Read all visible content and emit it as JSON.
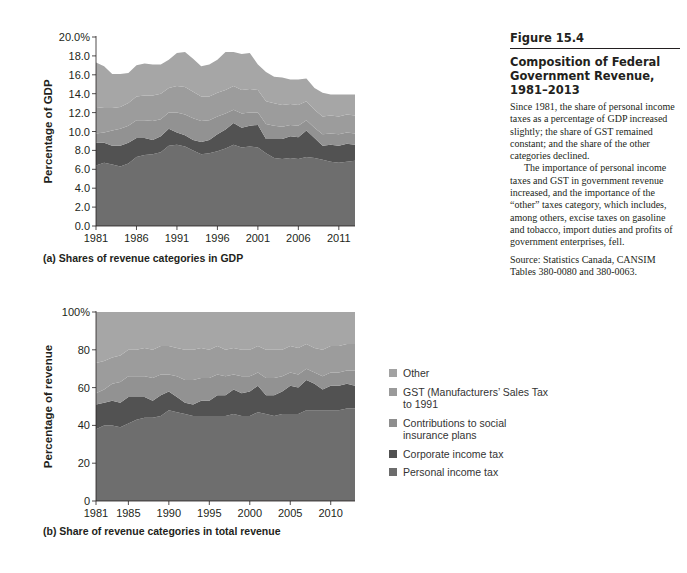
{
  "figure": {
    "number": "Figure 15.4",
    "title": "Composition of Federal Government Revenue, 1981–2013",
    "paragraph1": "Since 1981, the share of personal income taxes as a percentage of GDP increased slightly; the share of GST remained constant; and the share of the other categories declined.",
    "paragraph2": "The importance of personal income taxes and GST in government revenue increased, and the importance of the “other” taxes category, which includes, among others, excise taxes on gasoline and tobacco, import duties and profits of government enterprises, fell.",
    "source": "Source: Statistics Canada, CANSIM Tables 380-0080 and 380-0063."
  },
  "legend": [
    {
      "label": "Other",
      "color": "#a2a2a2"
    },
    {
      "label": "GST (Manufacturers’ Sales Tax to 1991",
      "color": "#9a9a9a"
    },
    {
      "label": "Contributions to social insurance plans",
      "color": "#8e8e8e"
    },
    {
      "label": "Corporate income tax",
      "color": "#505050"
    },
    {
      "label": "Personal income tax",
      "color": "#6c6c6c"
    }
  ],
  "chart_data": [
    {
      "type": "area",
      "stacked": true,
      "title": "(a) Shares of revenue categories in GDP",
      "xlabel": "",
      "ylabel": "Percentage of GDP",
      "ylim": [
        0,
        20
      ],
      "yticks": [
        "0.0",
        "2.0",
        "4.0",
        "6.0",
        "8.0",
        "10.0",
        "12.0",
        "14.0",
        "16.0",
        "18.0",
        "20.0%"
      ],
      "xticks": [
        "1981",
        "1986",
        "1991",
        "1996",
        "2001",
        "2006",
        "2011"
      ],
      "grid": false,
      "x": [
        1981,
        1982,
        1983,
        1984,
        1985,
        1986,
        1987,
        1988,
        1989,
        1990,
        1991,
        1992,
        1993,
        1994,
        1995,
        1996,
        1997,
        1998,
        1999,
        2000,
        2001,
        2002,
        2003,
        2004,
        2005,
        2006,
        2007,
        2008,
        2009,
        2010,
        2011,
        2012,
        2013
      ],
      "series": [
        {
          "name": "Personal income tax",
          "values": [
            6.4,
            6.7,
            6.5,
            6.3,
            6.6,
            7.3,
            7.5,
            7.6,
            7.8,
            8.5,
            8.6,
            8.4,
            8.0,
            7.6,
            7.7,
            7.9,
            8.2,
            8.6,
            8.3,
            8.4,
            8.3,
            7.7,
            7.2,
            7.1,
            7.2,
            7.1,
            7.3,
            7.2,
            7.0,
            6.8,
            6.7,
            6.8,
            6.9
          ]
        },
        {
          "name": "Corporate income tax",
          "values": [
            2.4,
            2.1,
            2.0,
            2.2,
            2.2,
            2.0,
            1.8,
            1.5,
            1.7,
            1.8,
            1.3,
            1.2,
            1.1,
            1.3,
            1.4,
            1.8,
            2.0,
            2.3,
            2.1,
            2.2,
            2.4,
            1.5,
            2.0,
            2.1,
            2.3,
            2.3,
            2.8,
            2.1,
            1.5,
            1.8,
            1.8,
            1.9,
            1.7
          ]
        },
        {
          "name": "Contributions to social insurance plans",
          "values": [
            1.0,
            1.1,
            1.6,
            1.8,
            1.8,
            1.9,
            1.9,
            2.0,
            1.8,
            1.7,
            2.1,
            2.2,
            2.3,
            2.2,
            2.1,
            1.9,
            1.7,
            1.4,
            1.5,
            1.4,
            1.3,
            1.6,
            1.4,
            1.3,
            1.2,
            1.2,
            1.1,
            1.1,
            1.2,
            1.2,
            1.2,
            1.2,
            1.2
          ]
        },
        {
          "name": "GST (Manufacturers’ Sales Tax to 1991",
          "values": [
            2.8,
            2.6,
            2.4,
            2.3,
            2.4,
            2.5,
            2.6,
            2.7,
            2.7,
            2.6,
            2.8,
            2.9,
            2.8,
            2.6,
            2.5,
            2.5,
            2.5,
            2.5,
            2.5,
            2.5,
            2.4,
            2.4,
            2.4,
            2.3,
            2.2,
            2.2,
            2.0,
            1.9,
            1.9,
            1.9,
            1.9,
            1.9,
            1.9
          ]
        },
        {
          "name": "Other",
          "values": [
            4.7,
            4.4,
            3.6,
            3.5,
            3.2,
            3.3,
            3.4,
            3.3,
            3.1,
            3.0,
            3.5,
            3.7,
            3.5,
            3.2,
            3.4,
            3.5,
            4.0,
            3.6,
            3.8,
            3.8,
            2.7,
            3.1,
            2.8,
            2.9,
            2.6,
            2.7,
            2.4,
            2.3,
            2.5,
            2.2,
            2.3,
            2.1,
            2.2
          ]
        }
      ]
    },
    {
      "type": "area",
      "stacked": true,
      "title": "(b) Share of revenue categories in total revenue",
      "xlabel": "",
      "ylabel": "Percentage of revenue",
      "ylim": [
        0,
        100
      ],
      "yticks": [
        "0",
        "20",
        "40",
        "60",
        "80",
        "100%"
      ],
      "xticks": [
        "1981",
        "1985",
        "1990",
        "1995",
        "2000",
        "2005",
        "2010"
      ],
      "grid": false,
      "x": [
        1981,
        1982,
        1983,
        1984,
        1985,
        1986,
        1987,
        1988,
        1989,
        1990,
        1991,
        1992,
        1993,
        1994,
        1995,
        1996,
        1997,
        1998,
        1999,
        2000,
        2001,
        2002,
        2003,
        2004,
        2005,
        2006,
        2007,
        2008,
        2009,
        2010,
        2011,
        2012,
        2013
      ],
      "series": [
        {
          "name": "Personal income tax",
          "values": [
            38,
            40,
            40,
            39,
            41,
            43,
            44,
            44,
            45,
            48,
            47,
            46,
            45,
            45,
            45,
            45,
            45,
            46,
            45,
            45,
            47,
            46,
            45,
            46,
            46,
            46,
            48,
            48,
            48,
            48,
            48,
            49,
            49
          ]
        },
        {
          "name": "Corporate income tax",
          "values": [
            13,
            12,
            13,
            13,
            14,
            12,
            11,
            9,
            11,
            10,
            8,
            6,
            6,
            8,
            8,
            11,
            11,
            13,
            12,
            13,
            14,
            10,
            11,
            12,
            15,
            14,
            16,
            14,
            11,
            13,
            13,
            13,
            12
          ]
        },
        {
          "name": "Contributions to social insurance plans",
          "values": [
            6,
            7,
            9,
            11,
            11,
            11,
            11,
            12,
            11,
            9,
            11,
            12,
            13,
            12,
            12,
            11,
            10,
            8,
            9,
            8,
            7,
            9,
            9,
            8,
            7,
            7,
            6,
            6,
            7,
            7,
            7,
            7,
            8
          ]
        },
        {
          "name": "GST (Manufacturers’ Sales Tax to 1991",
          "values": [
            16,
            15,
            14,
            14,
            14,
            14,
            15,
            15,
            15,
            15,
            15,
            16,
            16,
            16,
            15,
            15,
            14,
            14,
            14,
            14,
            14,
            15,
            15,
            14,
            14,
            14,
            13,
            13,
            14,
            14,
            14,
            14,
            14
          ]
        },
        {
          "name": "Other",
          "values": [
            27,
            26,
            24,
            23,
            20,
            20,
            19,
            20,
            18,
            18,
            19,
            20,
            20,
            19,
            20,
            18,
            20,
            19,
            20,
            20,
            18,
            20,
            20,
            20,
            18,
            19,
            17,
            19,
            20,
            18,
            18,
            17,
            17
          ]
        }
      ]
    }
  ]
}
